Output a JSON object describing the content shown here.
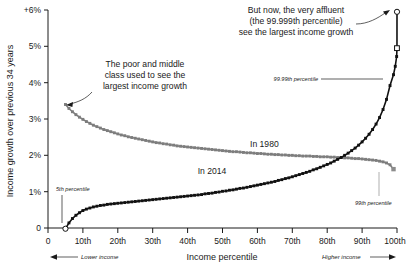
{
  "chart_data": {
    "type": "line",
    "title": "",
    "xlabel": "Income percentile",
    "ylabel": "Income growth over previous 34 years",
    "xlim": [
      0,
      100
    ],
    "ylim": [
      0,
      6
    ],
    "grid": false,
    "legend_position": "inline-labels",
    "x_ticks": [
      {
        "value": 0,
        "label": "0"
      },
      {
        "value": 10,
        "label": "10th"
      },
      {
        "value": 20,
        "label": "20th"
      },
      {
        "value": 30,
        "label": "30th"
      },
      {
        "value": 40,
        "label": "40th"
      },
      {
        "value": 50,
        "label": "50th"
      },
      {
        "value": 60,
        "label": "60th"
      },
      {
        "value": 70,
        "label": "70th"
      },
      {
        "value": 80,
        "label": "80th"
      },
      {
        "value": 90,
        "label": "90th"
      },
      {
        "value": 100,
        "label": "100th"
      }
    ],
    "y_ticks": [
      {
        "value": 0,
        "label": "0"
      },
      {
        "value": 1,
        "label": "1%"
      },
      {
        "value": 2,
        "label": "2%"
      },
      {
        "value": 3,
        "label": "3%"
      },
      {
        "value": 4,
        "label": "4%"
      },
      {
        "value": 5,
        "label": "5%"
      },
      {
        "value": 6,
        "label": "+6%"
      }
    ],
    "series": [
      {
        "name": "In 1980",
        "color": "#7d7d7d",
        "label": "In 1980",
        "label_x": 62,
        "label_y": 2.22,
        "x": [
          5,
          6,
          7,
          8,
          9,
          10,
          11,
          12,
          13,
          14,
          15,
          16,
          17,
          18,
          19,
          20,
          21,
          22,
          23,
          24,
          25,
          26,
          27,
          28,
          29,
          30,
          31,
          32,
          33,
          34,
          35,
          36,
          37,
          38,
          39,
          40,
          41,
          42,
          43,
          44,
          45,
          46,
          47,
          48,
          49,
          50,
          51,
          52,
          53,
          54,
          55,
          56,
          57,
          58,
          59,
          60,
          61,
          62,
          63,
          64,
          65,
          66,
          67,
          68,
          69,
          70,
          71,
          72,
          73,
          74,
          75,
          76,
          77,
          78,
          79,
          80,
          81,
          82,
          83,
          84,
          85,
          86,
          87,
          88,
          89,
          90,
          91,
          92,
          93,
          94,
          95,
          96,
          97,
          98,
          99
        ],
        "y": [
          3.4,
          3.29,
          3.2,
          3.12,
          3.05,
          2.99,
          2.93,
          2.88,
          2.83,
          2.79,
          2.75,
          2.71,
          2.68,
          2.65,
          2.62,
          2.59,
          2.56,
          2.54,
          2.51,
          2.49,
          2.47,
          2.45,
          2.43,
          2.41,
          2.39,
          2.37,
          2.35,
          2.34,
          2.32,
          2.31,
          2.29,
          2.28,
          2.26,
          2.25,
          2.24,
          2.23,
          2.22,
          2.21,
          2.2,
          2.19,
          2.18,
          2.17,
          2.16,
          2.15,
          2.14,
          2.13,
          2.12,
          2.11,
          2.1,
          2.1,
          2.09,
          2.08,
          2.07,
          2.07,
          2.06,
          2.05,
          2.05,
          2.04,
          2.03,
          2.03,
          2.02,
          2.02,
          2.01,
          2.01,
          2.0,
          2.0,
          1.99,
          1.99,
          1.98,
          1.98,
          1.98,
          1.97,
          1.97,
          1.96,
          1.96,
          1.96,
          1.95,
          1.95,
          1.94,
          1.94,
          1.93,
          1.93,
          1.92,
          1.91,
          1.91,
          1.9,
          1.89,
          1.88,
          1.87,
          1.86,
          1.84,
          1.82,
          1.79,
          1.74,
          1.62
        ]
      },
      {
        "name": "In 2014",
        "color": "#111111",
        "label": "In 2014",
        "label_x": 47,
        "label_y": 1.48,
        "x": [
          5,
          6,
          7,
          8,
          9,
          10,
          11,
          12,
          13,
          14,
          15,
          16,
          17,
          18,
          19,
          20,
          21,
          22,
          23,
          24,
          25,
          26,
          27,
          28,
          29,
          30,
          31,
          32,
          33,
          34,
          35,
          36,
          37,
          38,
          39,
          40,
          41,
          42,
          43,
          44,
          45,
          46,
          47,
          48,
          49,
          50,
          51,
          52,
          53,
          54,
          55,
          56,
          57,
          58,
          59,
          60,
          61,
          62,
          63,
          64,
          65,
          66,
          67,
          68,
          69,
          70,
          71,
          72,
          73,
          74,
          75,
          76,
          77,
          78,
          79,
          80,
          81,
          82,
          83,
          84,
          85,
          86,
          87,
          88,
          89,
          90,
          91,
          92,
          93,
          94,
          95,
          96,
          97,
          98,
          99,
          99.5,
          99.9,
          99.99,
          99.999
        ],
        "y": [
          -0.02,
          0.14,
          0.26,
          0.35,
          0.42,
          0.48,
          0.52,
          0.55,
          0.58,
          0.6,
          0.62,
          0.63,
          0.65,
          0.66,
          0.67,
          0.68,
          0.69,
          0.7,
          0.71,
          0.72,
          0.73,
          0.74,
          0.75,
          0.76,
          0.77,
          0.78,
          0.79,
          0.8,
          0.81,
          0.82,
          0.83,
          0.84,
          0.85,
          0.86,
          0.87,
          0.88,
          0.89,
          0.9,
          0.91,
          0.92,
          0.94,
          0.95,
          0.96,
          0.98,
          0.99,
          1.01,
          1.02,
          1.04,
          1.05,
          1.07,
          1.09,
          1.1,
          1.12,
          1.14,
          1.16,
          1.18,
          1.2,
          1.22,
          1.24,
          1.26,
          1.28,
          1.31,
          1.33,
          1.36,
          1.38,
          1.41,
          1.44,
          1.47,
          1.5,
          1.53,
          1.56,
          1.6,
          1.63,
          1.67,
          1.71,
          1.75,
          1.79,
          1.84,
          1.89,
          1.94,
          2.0,
          2.06,
          2.13,
          2.2,
          2.28,
          2.37,
          2.47,
          2.58,
          2.71,
          2.86,
          3.04,
          3.26,
          3.54,
          3.92,
          4.22,
          4.45,
          4.72,
          4.95,
          5.95
        ]
      }
    ],
    "markers": [
      {
        "name": "5th-percentile",
        "label": "5th percentile",
        "x": 5,
        "y": -0.02,
        "style": "open-circle",
        "color": "#111111"
      },
      {
        "name": "99th-percentile",
        "label": "99th percentile",
        "x": 99,
        "y": 1.62,
        "style": "filled-square",
        "color": "#8c8c8c"
      },
      {
        "name": "99.99th-percentile",
        "label": "99.99th percentile",
        "x": 99.99,
        "y": 4.95,
        "style": "open-square",
        "color": "#111111"
      },
      {
        "name": "99.999th-percentile",
        "label": "",
        "x": 99.999,
        "y": 5.95,
        "style": "open-circle",
        "color": "#111111"
      }
    ],
    "annotations": [
      {
        "name": "poor-middle-class-annotation",
        "lines": [
          "The poor and middle",
          "class used to see the",
          "largest income growth"
        ]
      },
      {
        "name": "affluent-annotation",
        "lines": [
          "But now, the very affluent",
          "(the 99.999th percentile)",
          "see the largest income growth"
        ]
      }
    ],
    "direction_labels": {
      "lower": "Lower income",
      "higher": "Higher income"
    }
  }
}
